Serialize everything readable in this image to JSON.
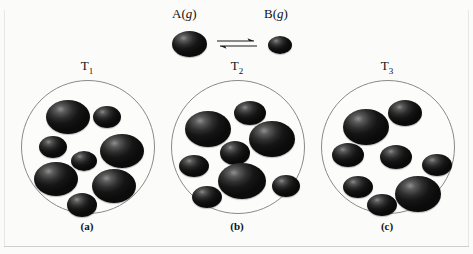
{
  "figure": {
    "reaction": {
      "reactant_label": "A(",
      "reactant_state": "g",
      "reactant_close": ")",
      "product_label": "B(",
      "product_state": "g",
      "product_close": ")",
      "arrow_symbol": "equilibrium-double-harpoon"
    },
    "colors": {
      "sphere_dark": "#141414",
      "sphere_highlight": "#8f8f8f",
      "vessel_stroke": "#8a8a8a",
      "background": "#fbfbfa",
      "text": "#111111"
    },
    "panels": [
      {
        "id": "a",
        "panel_label": "(a)",
        "temperature_label": "T",
        "temperature_subscript": "1",
        "a_count": 5,
        "b_count": 3,
        "total_count": 8,
        "spheres": [
          {
            "species": "A",
            "cx": 46,
            "cy": 36,
            "rx": 22,
            "ry": 17
          },
          {
            "species": "B",
            "cx": 85,
            "cy": 36,
            "rx": 14,
            "ry": 11
          },
          {
            "species": "B",
            "cx": 31,
            "cy": 66,
            "rx": 14,
            "ry": 11
          },
          {
            "species": "A",
            "cx": 100,
            "cy": 70,
            "rx": 22,
            "ry": 17
          },
          {
            "species": "B",
            "cx": 62,
            "cy": 80,
            "rx": 13,
            "ry": 10
          },
          {
            "species": "A",
            "cx": 34,
            "cy": 98,
            "rx": 22,
            "ry": 17
          },
          {
            "species": "A",
            "cx": 92,
            "cy": 105,
            "rx": 22,
            "ry": 17
          },
          {
            "species": "A",
            "cx": 60,
            "cy": 124,
            "rx": 15,
            "ry": 12
          }
        ]
      },
      {
        "id": "b",
        "panel_label": "(b)",
        "temperature_label": "T",
        "temperature_subscript": "2",
        "a_count": 3,
        "b_count": 5,
        "total_count": 8,
        "spheres": [
          {
            "species": "B",
            "cx": 78,
            "cy": 32,
            "rx": 16,
            "ry": 12
          },
          {
            "species": "A",
            "cx": 36,
            "cy": 48,
            "rx": 23,
            "ry": 18
          },
          {
            "species": "A",
            "cx": 100,
            "cy": 58,
            "rx": 23,
            "ry": 18
          },
          {
            "species": "B",
            "cx": 63,
            "cy": 72,
            "rx": 15,
            "ry": 12
          },
          {
            "species": "B",
            "cx": 22,
            "cy": 85,
            "rx": 15,
            "ry": 11
          },
          {
            "species": "A",
            "cx": 70,
            "cy": 100,
            "rx": 24,
            "ry": 18
          },
          {
            "species": "B",
            "cx": 114,
            "cy": 105,
            "rx": 14,
            "ry": 11
          },
          {
            "species": "B",
            "cx": 35,
            "cy": 116,
            "rx": 15,
            "ry": 11
          }
        ]
      },
      {
        "id": "c",
        "panel_label": "(c)",
        "temperature_label": "T",
        "temperature_subscript": "3",
        "a_count": 2,
        "b_count": 6,
        "total_count": 8,
        "spheres": [
          {
            "species": "B",
            "cx": 83,
            "cy": 32,
            "rx": 17,
            "ry": 13
          },
          {
            "species": "A",
            "cx": 44,
            "cy": 46,
            "rx": 23,
            "ry": 18
          },
          {
            "species": "B",
            "cx": 26,
            "cy": 74,
            "rx": 16,
            "ry": 12
          },
          {
            "species": "B",
            "cx": 74,
            "cy": 76,
            "rx": 16,
            "ry": 12
          },
          {
            "species": "B",
            "cx": 115,
            "cy": 84,
            "rx": 15,
            "ry": 11
          },
          {
            "species": "B",
            "cx": 36,
            "cy": 106,
            "rx": 15,
            "ry": 11
          },
          {
            "species": "A",
            "cx": 96,
            "cy": 113,
            "rx": 23,
            "ry": 18
          },
          {
            "species": "B",
            "cx": 60,
            "cy": 124,
            "rx": 15,
            "ry": 11
          }
        ]
      }
    ]
  },
  "chart_data": {
    "type": "diagram",
    "categories": [
      "(a)",
      "(b)",
      "(c)"
    ],
    "tick_labels": [
      "T1",
      "T2",
      "T3"
    ],
    "series": [
      {
        "name": "A(g)",
        "values": [
          5,
          3,
          2
        ]
      },
      {
        "name": "B(g)",
        "values": [
          3,
          5,
          6
        ]
      }
    ],
    "ylabel": "Number of molecules",
    "xlabel": "Temperature",
    "annotations": [
      "A(g)",
      "B(g)"
    ],
    "legend": [
      "A(g) large sphere",
      "B(g) small sphere"
    ],
    "grid": false
  }
}
